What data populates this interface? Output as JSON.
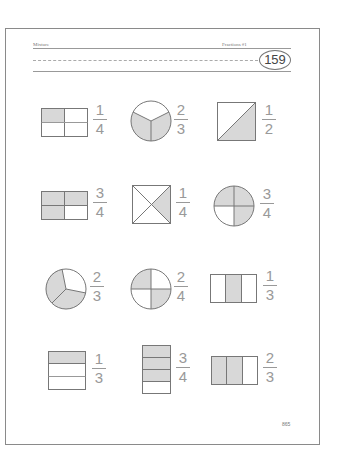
{
  "header": {
    "left_label": "Mixture",
    "right_label": "Fractions #1",
    "number": "159"
  },
  "footer": {
    "page_number": "865"
  },
  "colors": {
    "shade": "#d8d8d8",
    "stroke": "#777777",
    "fraction_text": "#999999"
  },
  "items": [
    {
      "shape": "rectangle-2x2",
      "shaded": 1,
      "numerator": "1",
      "denominator": "4"
    },
    {
      "shape": "circle-thirds",
      "shaded": 2,
      "numerator": "2",
      "denominator": "3"
    },
    {
      "shape": "square-diagonal-halves",
      "shaded": 1,
      "numerator": "1",
      "denominator": "2"
    },
    {
      "shape": "rectangle-2x2",
      "shaded": 3,
      "numerator": "3",
      "denominator": "4"
    },
    {
      "shape": "square-x-quarters",
      "shaded": 1,
      "numerator": "1",
      "denominator": "4"
    },
    {
      "shape": "circle-quarters",
      "shaded": 3,
      "numerator": "3",
      "denominator": "4"
    },
    {
      "shape": "circle-thirds",
      "shaded": 2,
      "numerator": "2",
      "denominator": "3"
    },
    {
      "shape": "circle-quarters",
      "shaded": 2,
      "numerator": "2",
      "denominator": "4"
    },
    {
      "shape": "rectangle-vertical-thirds",
      "shaded": 1,
      "numerator": "1",
      "denominator": "3"
    },
    {
      "shape": "rectangle-horizontal-thirds",
      "shaded": 1,
      "numerator": "1",
      "denominator": "3"
    },
    {
      "shape": "rectangle-horizontal-quarters",
      "shaded": 3,
      "numerator": "3",
      "denominator": "4"
    },
    {
      "shape": "rectangle-vertical-thirds",
      "shaded": 2,
      "numerator": "2",
      "denominator": "3"
    }
  ]
}
